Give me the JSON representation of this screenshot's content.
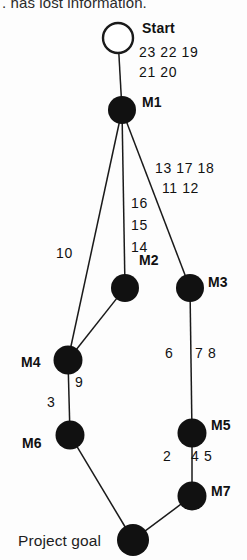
{
  "figure": {
    "truncated_caption": ". has lost information.",
    "colors": {
      "node_fill": "#111111",
      "edge_stroke": "#1a1a1a",
      "text": "#111111",
      "background": "#fdfdfd"
    }
  },
  "chart_data": {
    "type": "diagram",
    "nodes": [
      {
        "id": "start",
        "label": "Start",
        "x": 118,
        "y": 38,
        "r": 15,
        "style": "open",
        "label_dx": 24,
        "label_dy": -8
      },
      {
        "id": "M1",
        "label": "M1",
        "x": 122,
        "y": 110,
        "r": 14,
        "style": "filled",
        "label_dx": 20,
        "label_dy": -6
      },
      {
        "id": "M2",
        "label": "M2",
        "x": 125,
        "y": 288,
        "r": 14,
        "style": "filled",
        "label_dx": 14,
        "label_dy": -26
      },
      {
        "id": "M3",
        "label": "M3",
        "x": 190,
        "y": 288,
        "r": 14,
        "style": "filled",
        "label_dx": 18,
        "label_dy": -4
      },
      {
        "id": "M4",
        "label": "M4",
        "x": 68,
        "y": 360,
        "r": 14.5,
        "style": "filled",
        "label_dx": -47,
        "label_dy": 4
      },
      {
        "id": "M5",
        "label": "M5",
        "x": 192,
        "y": 433,
        "r": 14.5,
        "style": "filled",
        "label_dx": 19,
        "label_dy": -6
      },
      {
        "id": "M6",
        "label": "M6",
        "x": 70,
        "y": 435,
        "r": 14.5,
        "style": "filled",
        "label_dx": -48,
        "label_dy": 10
      },
      {
        "id": "M7",
        "label": "M7",
        "x": 192,
        "y": 496,
        "r": 14.5,
        "style": "filled",
        "label_dx": 19,
        "label_dy": -3
      },
      {
        "id": "goal",
        "label": "Project goal",
        "x": 133,
        "y": 540,
        "r": 16,
        "style": "filled",
        "label_dx": -115,
        "label_dy": 1
      }
    ],
    "edges": [
      {
        "from": "start",
        "to": "M1"
      },
      {
        "from": "M1",
        "to": "M4"
      },
      {
        "from": "M1",
        "to": "M2"
      },
      {
        "from": "M1",
        "to": "M3"
      },
      {
        "from": "M2",
        "to": "M4"
      },
      {
        "from": "M3",
        "to": "M5"
      },
      {
        "from": "M4",
        "to": "M6"
      },
      {
        "from": "M5",
        "to": "M7"
      },
      {
        "from": "M6",
        "to": "goal"
      },
      {
        "from": "M7",
        "to": "goal"
      }
    ],
    "edge_labels": [
      {
        "id": "start-m1-row1",
        "text": "23 22 19",
        "x": 139,
        "y": 54,
        "align": "left"
      },
      {
        "id": "start-m1-row2",
        "text": "21 20",
        "x": 139,
        "y": 74,
        "align": "left"
      },
      {
        "id": "m1-m3-row1",
        "text": "13 17 18",
        "x": 155,
        "y": 170,
        "align": "left"
      },
      {
        "id": "m1-m3-row2",
        "text": "11 12",
        "x": 162,
        "y": 190,
        "align": "left"
      },
      {
        "id": "m1-m2-a",
        "text": "16",
        "x": 131,
        "y": 205,
        "align": "left"
      },
      {
        "id": "m1-m2-b",
        "text": "15",
        "x": 131,
        "y": 227,
        "align": "left"
      },
      {
        "id": "m1-m2-c",
        "text": "14",
        "x": 131,
        "y": 249,
        "align": "left"
      },
      {
        "id": "m1-m4",
        "text": "10",
        "x": 56,
        "y": 255,
        "align": "left"
      },
      {
        "id": "m3-m5-left",
        "text": "6",
        "x": 165,
        "y": 355,
        "align": "left"
      },
      {
        "id": "m3-m5-right",
        "text": "7 8",
        "x": 195,
        "y": 355,
        "align": "left"
      },
      {
        "id": "m4-m6-right",
        "text": "9",
        "x": 75,
        "y": 384,
        "align": "left"
      },
      {
        "id": "m4-m6-left",
        "text": "3",
        "x": 47,
        "y": 404,
        "align": "left"
      },
      {
        "id": "m5-m7-left",
        "text": "2",
        "x": 163,
        "y": 458,
        "align": "left"
      },
      {
        "id": "m5-m7-right",
        "text": "4 5",
        "x": 191,
        "y": 458,
        "align": "left"
      }
    ],
    "xlabel": "",
    "ylabel": "",
    "legend": []
  }
}
